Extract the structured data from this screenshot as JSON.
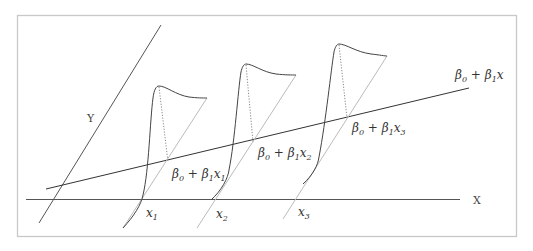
{
  "diagram": {
    "axes": {
      "x_label": "X",
      "y_label": "Y"
    },
    "regression_line_label": {
      "beta0": "β",
      "sub0": "0",
      "plus": " + ",
      "beta1": "β",
      "sub1": "1",
      "var": "x"
    },
    "points": [
      {
        "id": "x1",
        "x_label": "x",
        "x_sub": "1",
        "mean_label": {
          "b0": "β",
          "s0": "0",
          "plus": " + ",
          "b1": "β",
          "s1": "1",
          "v": "x",
          "vs": "1"
        }
      },
      {
        "id": "x2",
        "x_label": "x",
        "x_sub": "2",
        "mean_label": {
          "b0": "β",
          "s0": "0",
          "plus": " + ",
          "b1": "β",
          "s1": "1",
          "v": "x",
          "vs": "2"
        }
      },
      {
        "id": "x3",
        "x_label": "x",
        "x_sub": "3",
        "mean_label": {
          "b0": "β",
          "s0": "0",
          "plus": " + ",
          "b1": "β",
          "s1": "1",
          "v": "x",
          "vs": "3"
        }
      }
    ],
    "colors": {
      "frame": "#c8c8c8",
      "lines": "#333333",
      "guide": "#bbbbbb",
      "dotted": "#888888"
    }
  }
}
